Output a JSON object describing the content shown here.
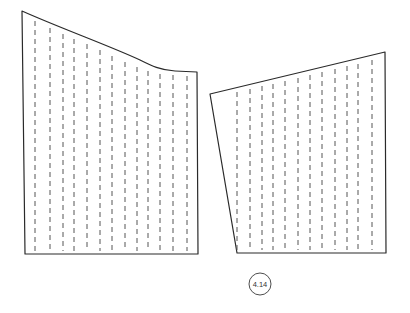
{
  "figure": {
    "label": "4.14",
    "colors": {
      "line": "#2a2a2a",
      "dash": "#555555",
      "background": "#ffffff"
    },
    "left_piece": {
      "outline_top": "M22,11 C60,28 110,46 140,60 C152,66 160,70 175,71 L197,72",
      "corners": {
        "top_left": [
          22,
          11
        ],
        "top_right": [
          197,
          72
        ],
        "bottom_right": [
          198,
          254
        ],
        "bottom_left": [
          25,
          254
        ]
      },
      "grain_lines_x": [
        35,
        50,
        63,
        74,
        87,
        100,
        112,
        125,
        137,
        148,
        160,
        173,
        187
      ],
      "grain_top_y": [
        17,
        24,
        30,
        35,
        40,
        46,
        52,
        58,
        63,
        67,
        70,
        71,
        72
      ]
    },
    "right_piece": {
      "corners": {
        "top_left": [
          210,
          94
        ],
        "top_right": [
          385,
          52
        ],
        "bottom_right": [
          386,
          253
        ],
        "bottom_left": [
          237,
          253
        ]
      },
      "grain_lines_x": [
        237,
        250,
        262,
        273,
        285,
        298,
        310,
        322,
        335,
        347,
        358,
        372
      ],
      "grain_top_y": [
        88,
        85,
        82,
        80,
        77,
        74,
        71,
        68,
        65,
        62,
        60,
        56
      ]
    },
    "badge": {
      "cx": 260,
      "cy": 284,
      "r": 11
    }
  }
}
